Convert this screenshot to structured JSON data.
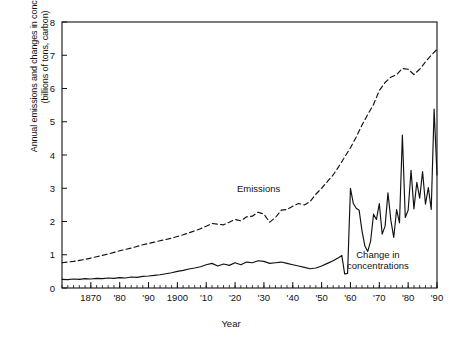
{
  "figure": {
    "width": 462,
    "height": 344,
    "background": "#ffffff",
    "line_color": "#111111"
  },
  "axis": {
    "y_title_line1": "Annual emissions and changes in concentrations",
    "y_title_line2": "(billions of tons, carbon)",
    "x_title": "Year"
  },
  "annotations": [
    {
      "name": "emissions",
      "text": "Emissions"
    },
    {
      "name": "change-in-concentrations",
      "line1": "Change in",
      "line2": "concentrations"
    }
  ],
  "chart_data": {
    "type": "line",
    "title": "",
    "xlabel": "Year",
    "ylabel": "Annual emissions and changes in concentrations (billions of tons, carbon)",
    "xlim": [
      1860,
      1990
    ],
    "ylim": [
      0,
      8
    ],
    "grid": false,
    "legend": "inline-annotations",
    "y_ticks": [
      0,
      1,
      2,
      3,
      4,
      5,
      6,
      7,
      8
    ],
    "y_tick_labels": [
      "0",
      "1",
      "2",
      "3",
      "4",
      "5",
      "6",
      "7",
      "8"
    ],
    "x_ticks": [
      1870,
      1880,
      1890,
      1900,
      1910,
      1920,
      1930,
      1940,
      1950,
      1960,
      1970,
      1980,
      1990
    ],
    "x_tick_labels": [
      "1870",
      "'80",
      "'90",
      "1900",
      "'10",
      "'20",
      "'30",
      "'40",
      "'50",
      "'60",
      "'70",
      "'80",
      "'90"
    ],
    "x_minor_tick_step": 2,
    "series": [
      {
        "name": "Emissions",
        "style": "dashed",
        "x": [
          1860,
          1862,
          1864,
          1866,
          1868,
          1870,
          1872,
          1874,
          1876,
          1878,
          1880,
          1882,
          1884,
          1886,
          1888,
          1890,
          1892,
          1894,
          1896,
          1898,
          1900,
          1902,
          1904,
          1906,
          1908,
          1910,
          1912,
          1914,
          1916,
          1918,
          1920,
          1922,
          1924,
          1926,
          1928,
          1930,
          1932,
          1934,
          1936,
          1938,
          1940,
          1942,
          1944,
          1946,
          1948,
          1950,
          1952,
          1954,
          1956,
          1958,
          1960,
          1962,
          1964,
          1966,
          1968,
          1970,
          1972,
          1974,
          1976,
          1978,
          1980,
          1982,
          1984,
          1986,
          1988,
          1990
        ],
        "y": [
          0.76,
          0.78,
          0.8,
          0.83,
          0.86,
          0.9,
          0.94,
          0.98,
          1.02,
          1.07,
          1.12,
          1.16,
          1.2,
          1.25,
          1.3,
          1.34,
          1.38,
          1.42,
          1.46,
          1.5,
          1.55,
          1.6,
          1.66,
          1.72,
          1.78,
          1.86,
          1.94,
          1.92,
          1.9,
          1.98,
          2.06,
          2.02,
          2.14,
          2.16,
          2.28,
          2.22,
          1.98,
          2.12,
          2.34,
          2.36,
          2.46,
          2.54,
          2.5,
          2.6,
          2.82,
          3.0,
          3.2,
          3.4,
          3.66,
          3.94,
          4.22,
          4.54,
          4.9,
          5.22,
          5.52,
          5.94,
          6.18,
          6.34,
          6.42,
          6.6,
          6.58,
          6.42,
          6.58,
          6.8,
          7.0,
          7.18
        ]
      },
      {
        "name": "Change in concentrations",
        "style": "solid",
        "x": [
          1860,
          1862,
          1864,
          1866,
          1868,
          1870,
          1872,
          1874,
          1876,
          1878,
          1880,
          1882,
          1884,
          1886,
          1888,
          1890,
          1892,
          1894,
          1896,
          1898,
          1900,
          1902,
          1904,
          1906,
          1908,
          1910,
          1912,
          1914,
          1916,
          1918,
          1920,
          1922,
          1924,
          1926,
          1928,
          1930,
          1932,
          1934,
          1936,
          1938,
          1940,
          1942,
          1944,
          1946,
          1948,
          1950,
          1952,
          1954,
          1956,
          1957,
          1958,
          1959,
          1960,
          1961,
          1962,
          1963,
          1964,
          1965,
          1966,
          1967,
          1968,
          1969,
          1970,
          1971,
          1972,
          1973,
          1974,
          1975,
          1976,
          1977,
          1978,
          1979,
          1980,
          1981,
          1982,
          1983,
          1984,
          1985,
          1986,
          1987,
          1988,
          1989,
          1990
        ],
        "y": [
          0.26,
          0.25,
          0.27,
          0.26,
          0.28,
          0.27,
          0.29,
          0.28,
          0.3,
          0.29,
          0.31,
          0.3,
          0.33,
          0.32,
          0.35,
          0.36,
          0.38,
          0.4,
          0.43,
          0.46,
          0.5,
          0.53,
          0.57,
          0.6,
          0.64,
          0.7,
          0.74,
          0.66,
          0.72,
          0.68,
          0.76,
          0.7,
          0.78,
          0.76,
          0.82,
          0.8,
          0.74,
          0.76,
          0.78,
          0.74,
          0.7,
          0.66,
          0.62,
          0.58,
          0.6,
          0.66,
          0.74,
          0.82,
          0.92,
          0.98,
          0.42,
          0.44,
          3.0,
          2.54,
          2.4,
          2.34,
          1.72,
          1.26,
          1.1,
          1.42,
          2.22,
          2.06,
          2.54,
          1.62,
          1.86,
          2.86,
          2.04,
          1.52,
          2.36,
          1.96,
          4.6,
          2.12,
          2.34,
          3.54,
          2.38,
          3.18,
          2.7,
          3.5,
          2.52,
          3.02,
          2.36,
          5.38,
          3.4
        ]
      }
    ]
  }
}
